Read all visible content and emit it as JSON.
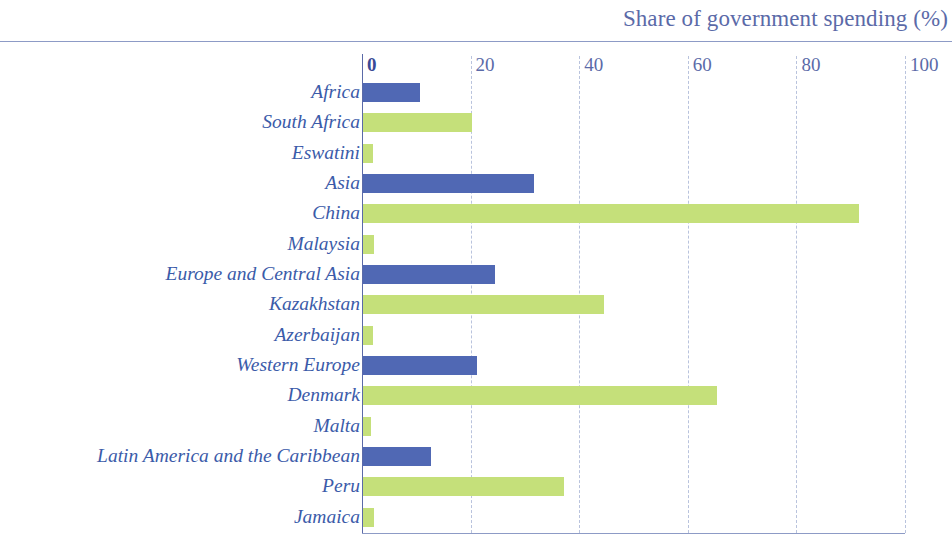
{
  "chart_data": {
    "type": "bar",
    "orientation": "horizontal",
    "title": "Share of government spending (%)",
    "xlabel": "",
    "ylabel": "",
    "xlim": [
      0,
      100
    ],
    "xticks": [
      0,
      20,
      40,
      60,
      80,
      100
    ],
    "xtick_labels": [
      "0",
      "20",
      "40",
      "60",
      "80",
      "100"
    ],
    "grid": "vertical-dashed",
    "legend": null,
    "colors": {
      "region": "#5068b4",
      "country": "#c5e07a",
      "label_text": "#3b5ba9",
      "title_text": "#5b6aa8",
      "axis_text": "#5b6aa8",
      "gridline": "#b9c3dd",
      "rule": "#8d9bc6",
      "background": "#ffffff"
    },
    "categories": [
      "Africa",
      "South Africa",
      "Eswatini",
      "Asia",
      "China",
      "Malaysia",
      "Europe and Central Asia",
      "Kazakhstan",
      "Azerbaijan",
      "Western Europe",
      "Denmark",
      "Malta",
      "Latin America and the Caribbean",
      "Peru",
      "Jamaica"
    ],
    "values": [
      10.5,
      20.0,
      1.8,
      31.5,
      91.4,
      2.0,
      24.3,
      44.4,
      1.8,
      21.0,
      65.2,
      1.5,
      12.6,
      37.0,
      2.0
    ],
    "series_kinds": [
      "region",
      "country",
      "country",
      "region",
      "country",
      "country",
      "region",
      "country",
      "country",
      "region",
      "country",
      "country",
      "region",
      "country",
      "country"
    ],
    "rows": [
      {
        "label": "Africa",
        "value": 10.5,
        "kind": "region"
      },
      {
        "label": "South Africa",
        "value": 20.0,
        "kind": "country"
      },
      {
        "label": "Eswatini",
        "value": 1.8,
        "kind": "country"
      },
      {
        "label": "Asia",
        "value": 31.5,
        "kind": "region"
      },
      {
        "label": "China",
        "value": 91.4,
        "kind": "country"
      },
      {
        "label": "Malaysia",
        "value": 2.0,
        "kind": "country"
      },
      {
        "label": "Europe and Central Asia",
        "value": 24.3,
        "kind": "region"
      },
      {
        "label": "Kazakhstan",
        "value": 44.4,
        "kind": "country"
      },
      {
        "label": "Azerbaijan",
        "value": 1.8,
        "kind": "country"
      },
      {
        "label": "Western Europe",
        "value": 21.0,
        "kind": "region"
      },
      {
        "label": "Denmark",
        "value": 65.2,
        "kind": "country"
      },
      {
        "label": "Malta",
        "value": 1.5,
        "kind": "country"
      },
      {
        "label": "Latin America and the Caribbean",
        "value": 12.6,
        "kind": "region"
      },
      {
        "label": "Peru",
        "value": 37.0,
        "kind": "country"
      },
      {
        "label": "Jamaica",
        "value": 2.0,
        "kind": "country"
      }
    ]
  }
}
